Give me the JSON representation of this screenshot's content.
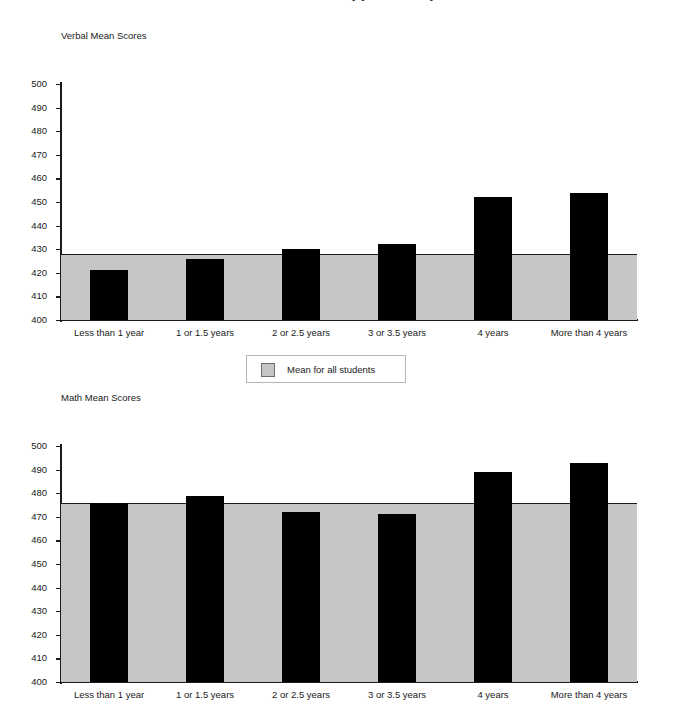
{
  "document": {
    "title_fragment": "Mean SAT I scores by years of study"
  },
  "legend": {
    "label": "Mean for all students",
    "swatch_color": "#c6c6c6"
  },
  "colors": {
    "bar": "#000000",
    "band": "#c6c6c6",
    "axis": "#1a1a1a",
    "background": "#ffffff"
  },
  "chart_data": [
    {
      "type": "bar",
      "title": "Verbal Mean Scores",
      "xlabel": "",
      "ylabel": "",
      "ylim": [
        400,
        500
      ],
      "ytick_step": 10,
      "yticks": [
        400,
        410,
        420,
        430,
        440,
        450,
        460,
        470,
        480,
        490,
        500
      ],
      "grid": false,
      "legend_position": "below-chart",
      "categories": [
        "Less than 1 year",
        "1 or 1.5 years",
        "2 or 2.5 years",
        "3 or 3.5 years",
        "4 years",
        "More than 4 years"
      ],
      "values": [
        421,
        426,
        430,
        432,
        452,
        454
      ],
      "reference_line": {
        "name": "Mean for all students",
        "value": 428
      }
    },
    {
      "type": "bar",
      "title": "Math Mean Scores",
      "xlabel": "",
      "ylabel": "",
      "ylim": [
        400,
        500
      ],
      "ytick_step": 10,
      "yticks": [
        400,
        410,
        420,
        430,
        440,
        450,
        460,
        470,
        480,
        490,
        500
      ],
      "grid": false,
      "legend_position": "above-chart",
      "categories": [
        "Less than 1 year",
        "1 or 1.5 years",
        "2 or 2.5 years",
        "3 or 3.5 years",
        "4 years",
        "More than 4 years"
      ],
      "values": [
        476,
        479,
        472,
        471,
        489,
        493
      ],
      "reference_line": {
        "name": "Mean for all students",
        "value": 476
      }
    }
  ]
}
